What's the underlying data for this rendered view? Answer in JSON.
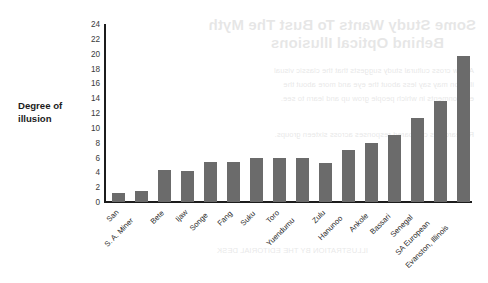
{
  "chart_data": {
    "type": "bar",
    "title": "",
    "xlabel": "",
    "ylabel": "Degree of illusion",
    "ylim": [
      0,
      24
    ],
    "ytick_step": 2,
    "grid": false,
    "legend": "none",
    "bar_color": "#6b6b6b",
    "axis_color": "#1c1c1c",
    "categories": [
      "San",
      "S. A. Miner",
      "Bete",
      "Ijaw",
      "Songe",
      "Fang",
      "Suku",
      "Toro",
      "Yuendumu",
      "Zulu",
      "Hanunoo",
      "Ankole",
      "Bassari",
      "Senegal",
      "SA European",
      "Evanston, Illinois"
    ],
    "values": [
      1.2,
      1.5,
      4.3,
      4.2,
      5.4,
      5.4,
      6.0,
      6.0,
      6.0,
      5.3,
      7.0,
      8.0,
      9.1,
      11.3,
      13.6,
      19.7
    ],
    "yticks": [
      "0",
      "2",
      "4",
      "6",
      "8",
      "10",
      "12",
      "14",
      "16",
      "18",
      "20",
      "22",
      "24"
    ],
    "ytick_values": [
      0,
      2,
      4,
      6,
      8,
      10,
      12,
      14,
      16,
      18,
      20,
      22,
      24
    ]
  },
  "axis_label": {
    "line1": "Degree of",
    "line2": "illusion"
  },
  "bleed_through": {
    "title_line1": "Some Study Wants To Bust The Myth",
    "title_line2": "Behind Optical Illusions",
    "body_line1": "A new cross cultural study suggests that the classic visual",
    "body_line2": "illusion may say less about the eye and more about the",
    "body_line3": "environments in which people grow up and learn to see.",
    "body_line4": "Researchers compared responses across sixteen groups.",
    "body_line5": "ILLUSTRATION BY THE EDITORIAL DESK"
  }
}
